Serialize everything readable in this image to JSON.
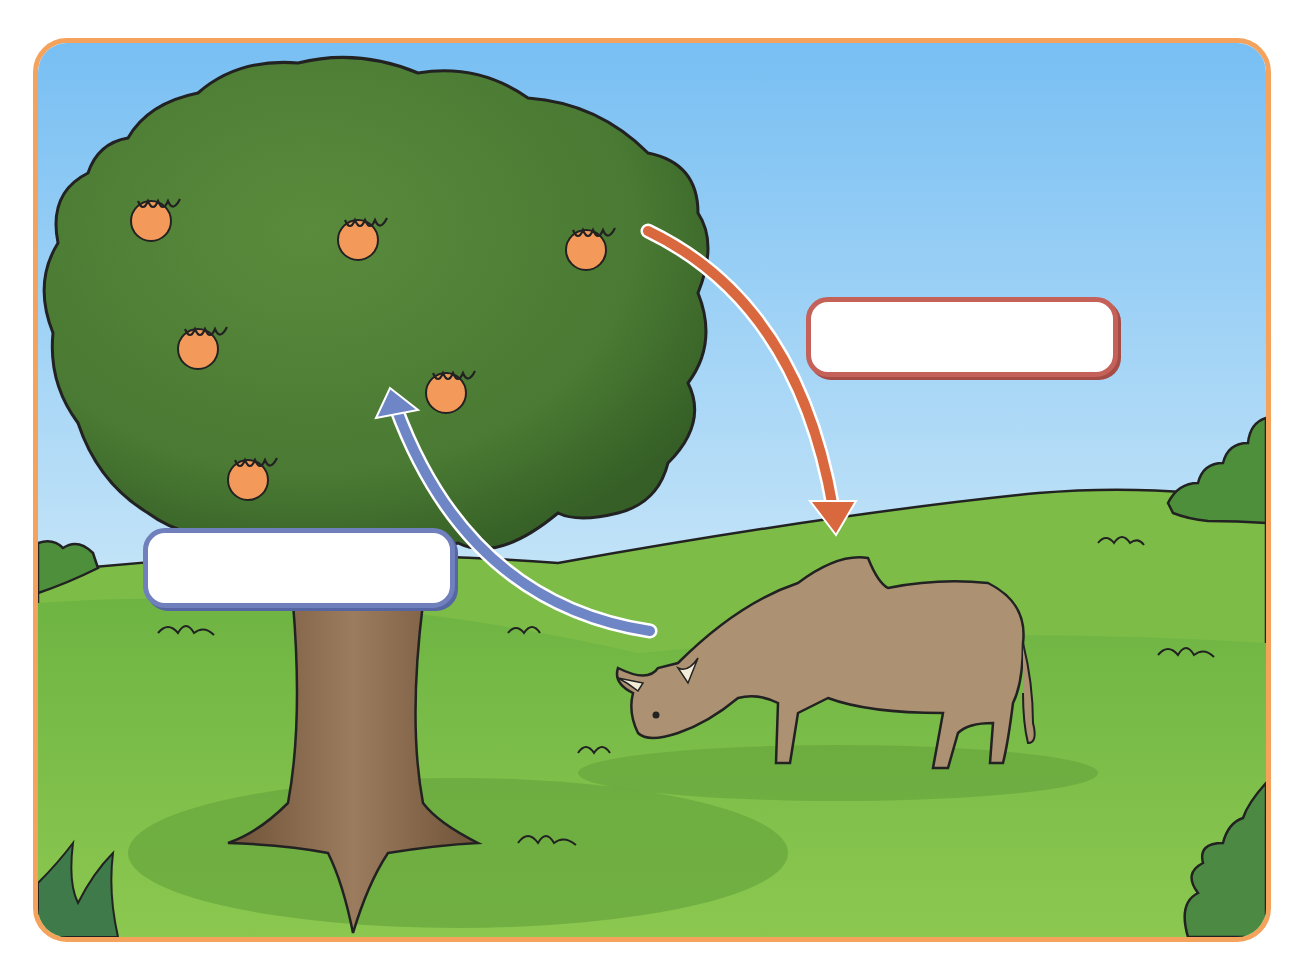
{
  "diagram": {
    "type": "illustration",
    "frame": {
      "border_color": "#f4a25c"
    },
    "colors": {
      "sky_top": "#7fc2f2",
      "sky_bottom": "#d9eefa",
      "grass": "#86c24a",
      "grass_dark": "#5fa33a",
      "canopy": "#4f7f35",
      "canopy_dark": "#3c662a",
      "trunk": "#8a6a4e",
      "cow": "#ad9173",
      "orange_fruit": "#f39a5b",
      "arrow_red": "#d9683f",
      "arrow_blue": "#6f86c6",
      "box_red_border": "#c4625a",
      "box_blue_border": "#6f80bd"
    },
    "elements": {
      "tree": {
        "name": "orange tree",
        "fruit_count": 6
      },
      "cow": {
        "name": "grazing cow"
      },
      "arrow_tree_to_cow": {
        "direction": "from tree canopy down to cow",
        "color": "red-orange"
      },
      "arrow_cow_to_tree": {
        "direction": "from cow up to tree canopy",
        "color": "blue"
      }
    },
    "labels": {
      "top_right_box": "",
      "bottom_left_box": ""
    }
  }
}
